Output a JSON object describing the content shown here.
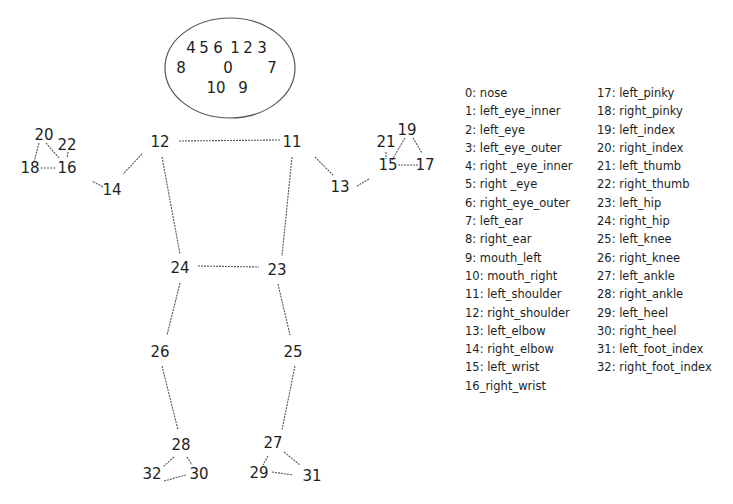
{
  "diagram": {
    "head_ellipse": {
      "cx": 230,
      "cy": 68,
      "rx": 65,
      "ry": 50
    },
    "keypoints": [
      {
        "id": "4",
        "x": 191,
        "y": 53
      },
      {
        "id": "5",
        "x": 204,
        "y": 53
      },
      {
        "id": "6",
        "x": 218,
        "y": 53
      },
      {
        "id": "1",
        "x": 235,
        "y": 53
      },
      {
        "id": "2",
        "x": 248,
        "y": 53
      },
      {
        "id": "3",
        "x": 262,
        "y": 53
      },
      {
        "id": "8",
        "x": 181,
        "y": 73
      },
      {
        "id": "0",
        "x": 228,
        "y": 73
      },
      {
        "id": "7",
        "x": 272,
        "y": 73
      },
      {
        "id": "10",
        "x": 216,
        "y": 93
      },
      {
        "id": "9",
        "x": 243,
        "y": 93
      },
      {
        "id": "12",
        "x": 160,
        "y": 147
      },
      {
        "id": "11",
        "x": 292,
        "y": 147
      },
      {
        "id": "14",
        "x": 112,
        "y": 195
      },
      {
        "id": "13",
        "x": 340,
        "y": 192
      },
      {
        "id": "20",
        "x": 44,
        "y": 140
      },
      {
        "id": "22",
        "x": 67,
        "y": 150
      },
      {
        "id": "18",
        "x": 30,
        "y": 173
      },
      {
        "id": "16",
        "x": 67,
        "y": 173
      },
      {
        "id": "21",
        "x": 386,
        "y": 147
      },
      {
        "id": "19",
        "x": 407,
        "y": 135
      },
      {
        "id": "15",
        "x": 388,
        "y": 170
      },
      {
        "id": "17",
        "x": 425,
        "y": 170
      },
      {
        "id": "24",
        "x": 180,
        "y": 273
      },
      {
        "id": "23",
        "x": 277,
        "y": 275
      },
      {
        "id": "26",
        "x": 160,
        "y": 357
      },
      {
        "id": "25",
        "x": 293,
        "y": 357
      },
      {
        "id": "28",
        "x": 181,
        "y": 450
      },
      {
        "id": "32",
        "x": 152,
        "y": 479
      },
      {
        "id": "30",
        "x": 199,
        "y": 479
      },
      {
        "id": "27",
        "x": 273,
        "y": 448
      },
      {
        "id": "29",
        "x": 259,
        "y": 478
      },
      {
        "id": "31",
        "x": 312,
        "y": 481
      }
    ],
    "connections": [
      [
        179,
        141,
        280,
        140
      ],
      [
        142,
        154,
        123,
        174
      ],
      [
        315,
        157,
        333,
        175
      ],
      [
        103,
        187,
        92,
        181
      ],
      [
        369,
        179,
        357,
        186
      ],
      [
        162,
        157,
        180,
        254
      ],
      [
        292,
        157,
        282,
        256
      ],
      [
        198,
        266,
        259,
        267
      ],
      [
        180,
        283,
        167,
        335
      ],
      [
        278,
        284,
        290,
        335
      ],
      [
        162,
        366,
        178,
        430
      ],
      [
        295,
        366,
        282,
        430
      ],
      [
        39,
        143,
        34,
        162
      ],
      [
        46,
        143,
        59,
        158
      ],
      [
        68,
        152,
        67,
        158
      ],
      [
        41,
        168,
        55,
        168
      ],
      [
        386,
        152,
        386,
        159
      ],
      [
        405,
        138,
        392,
        160
      ],
      [
        413,
        138,
        422,
        153
      ],
      [
        398,
        165,
        418,
        165
      ],
      [
        174,
        457,
        163,
        467
      ],
      [
        187,
        457,
        192,
        465
      ],
      [
        164,
        481,
        186,
        475
      ],
      [
        268,
        456,
        263,
        465
      ],
      [
        284,
        452,
        300,
        465
      ],
      [
        272,
        472,
        293,
        475
      ]
    ]
  },
  "legend": {
    "column_1": [
      "0: nose",
      "1: left_eye_inner",
      "2: left_eye",
      "3: left_eye_outer",
      "4: right _eye_inner",
      "5: right _eye",
      "6: right_eye_outer",
      "7: left_ear",
      "8: right_ear",
      "9: mouth_left",
      "10: mouth_right",
      "11: left_shoulder",
      "12: right_shoulder",
      "13: left_elbow",
      "14: right_elbow",
      "15: left_wrist",
      "16_right_wrist"
    ],
    "column_2": [
      "17: left_pinky",
      "18: right_pinky",
      "19: left_index",
      "20: right_index",
      "21: left_thumb",
      "22: right_thumb",
      "23: left_hip",
      "24: right_hip",
      "25: left_knee",
      "26: right_knee",
      "27: left_ankle",
      "28: right_ankle",
      "29: left_heel",
      "30: right_heel",
      "31: left_foot_index",
      "32: right_foot_index"
    ]
  },
  "colors": {
    "text": "#1e1e1e",
    "line": "#555555",
    "background": "#ffffff"
  }
}
